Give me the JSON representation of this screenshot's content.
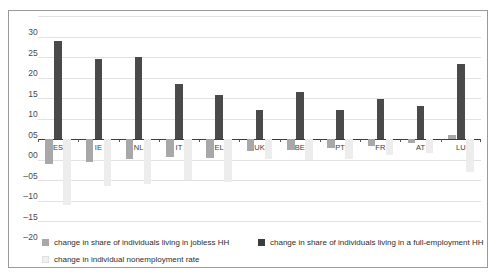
{
  "chart_data": {
    "type": "bar",
    "title": "",
    "xlabel": "",
    "ylabel": "",
    "ylim": [
      -20,
      30
    ],
    "yticks": [
      30,
      25,
      20,
      15,
      10,
      5,
      0,
      -5,
      -10,
      -15,
      -20
    ],
    "ytick_labels": [
      "30",
      "25",
      "20",
      "15",
      "10",
      "05",
      "00",
      "–05",
      "–10",
      "–15",
      "–20"
    ],
    "grid": true,
    "legend_position": "bottom",
    "categories": [
      "ES",
      "IE",
      "NL",
      "IT",
      "EL",
      "UK",
      "BE",
      "PT",
      "FR",
      "AT",
      "LU"
    ],
    "series": [
      {
        "name": "change in share of individuals living in jobless HH",
        "color": "#a8a8a8",
        "values": [
          -6.2,
          -5.6,
          -4.8,
          -4.5,
          -4.6,
          -3.0,
          -2.6,
          -2.3,
          -1.6,
          -1.0,
          1.0
        ]
      },
      {
        "name": "change in share of individuals living in a full-employment HH",
        "color": "#4a4a4a",
        "values": [
          23.9,
          19.5,
          20.0,
          13.3,
          10.8,
          7.0,
          11.4,
          7.0,
          9.7,
          8.0,
          18.2
        ]
      },
      {
        "name": "change in individual nonemployment rate",
        "color": "#ededed",
        "values": [
          -16.0,
          -11.5,
          -11.0,
          -10.0,
          -10.5,
          -4.8,
          -5.0,
          -4.8,
          -4.0,
          -3.5,
          -8.0
        ]
      }
    ]
  },
  "legend": {
    "items": [
      {
        "label": "change in share of individuals living in jobless HH"
      },
      {
        "label": "change in share of individuals living in a full-employment HH"
      },
      {
        "label": "change in individual nonemployment rate"
      }
    ]
  }
}
